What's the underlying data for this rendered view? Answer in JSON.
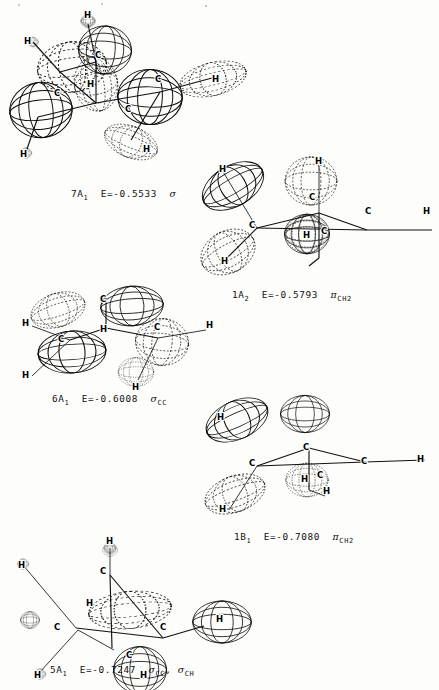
{
  "figure": {
    "kind": "molecular-orbital-contour-plots",
    "background_color": "#fdfdfc",
    "ink_color": "#0d0d0d",
    "panel_count": 5
  },
  "panels": [
    {
      "id": "panel-7a1",
      "orbital": "7A",
      "orbital_sub": "1",
      "energy_prefix": "E=",
      "energy": "-0.5533",
      "symmetry_symbol": "σ",
      "symmetry_sub": "",
      "caption": "7A1  E=-0.5533  σ",
      "atom_labels": [
        "H",
        "H",
        "C",
        "H",
        "C",
        "H",
        "C",
        "H",
        "H"
      ]
    },
    {
      "id": "panel-1a2",
      "orbital": "1A",
      "orbital_sub": "2",
      "energy_prefix": "E=",
      "energy": "-0.5793",
      "symmetry_symbol": "π",
      "symmetry_sub": "CH2",
      "caption": "1A2  E=-0.5793  πCH2",
      "atom_labels": [
        "H",
        "H",
        "C",
        "C",
        "C",
        "H",
        "H",
        "C",
        "H"
      ]
    },
    {
      "id": "panel-6a1",
      "orbital": "6A",
      "orbital_sub": "1",
      "energy_prefix": "E=",
      "energy": "-0.6008",
      "symmetry_symbol": "σ",
      "symmetry_sub": "CC",
      "caption": "6A1  E=-0.6008  σCC",
      "atom_labels": [
        "H",
        "C",
        "H",
        "C",
        "H",
        "C",
        "H",
        "H"
      ]
    },
    {
      "id": "panel-1b1",
      "orbital": "1B",
      "orbital_sub": "1",
      "energy_prefix": "E=",
      "energy": "-0.7080",
      "symmetry_symbol": "π",
      "symmetry_sub": "CH2",
      "caption": "1B1  E=-0.7080  πCH2",
      "atom_labels": [
        "H",
        "C",
        "C",
        "C",
        "H",
        "H",
        "C",
        "H"
      ]
    },
    {
      "id": "panel-5a1",
      "orbital": "5A",
      "orbital_sub": "1",
      "energy_prefix": "E=",
      "energy": "-0.7247",
      "symmetry_symbol": "σ",
      "symmetry_sub": "CC",
      "symmetry_symbol2": "σ",
      "symmetry_sub2": "CH",
      "separator": ", ",
      "caption": "5A1  E=-0.7247  σCC, σCH",
      "atom_labels": [
        "H",
        "C",
        "H",
        "C",
        "H",
        "C",
        "H",
        "H",
        "H"
      ]
    }
  ],
  "atoms": {
    "carbon": "C",
    "hydrogen": "H"
  }
}
